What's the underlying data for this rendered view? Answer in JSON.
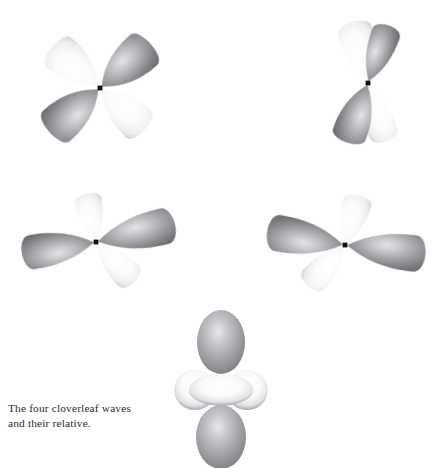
{
  "page": {
    "background_color": "#ffffff",
    "width": 442,
    "height": 468,
    "running_head": "g      y                 %"
  },
  "caption": {
    "line1": "The four cloverleaf waves",
    "line2": "and their relative."
  },
  "palette": {
    "dark_lobe_edge": "#6e6e72",
    "dark_lobe_core": "#d3d3d6",
    "dark_lobe_mid": "#9a9a9e",
    "light_lobe_edge": "#cfcfd4",
    "light_lobe_core": "#ffffff",
    "nucleus": "#111111",
    "torus_edge": "#a9a9ae",
    "torus_core": "#fdfdfd",
    "caption_text": "#2b2b2b"
  },
  "figure": {
    "title": "The four cloverleaf waves and their relative",
    "orbital_count": 5,
    "orbitals": [
      {
        "name": "cloverleaf-top-left",
        "label": "d-orbital cloverleaf, diagonal lobes",
        "cx": 100,
        "cy": 88,
        "lobes": [
          {
            "name": "lobe-upper-left",
            "angle": 139,
            "length": 64,
            "width": 40,
            "shade": "light"
          },
          {
            "name": "lobe-upper-right",
            "angle": 41,
            "length": 68,
            "width": 42,
            "shade": "dark"
          },
          {
            "name": "lobe-lower-left",
            "angle": 221,
            "length": 68,
            "width": 42,
            "shade": "dark"
          },
          {
            "name": "lobe-lower-right",
            "angle": 317,
            "length": 62,
            "width": 38,
            "shade": "light"
          }
        ]
      },
      {
        "name": "cloverleaf-top-right",
        "label": "d-orbital cloverleaf, narrow vertical lobes",
        "cx": 368,
        "cy": 83,
        "lobes": [
          {
            "name": "lobe-upper-left",
            "angle": 104,
            "length": 64,
            "width": 36,
            "shade": "light"
          },
          {
            "name": "lobe-upper-right",
            "angle": 70,
            "length": 62,
            "width": 30,
            "shade": "dark"
          },
          {
            "name": "lobe-lower-left",
            "angle": 250,
            "length": 64,
            "width": 36,
            "shade": "dark"
          },
          {
            "name": "lobe-lower-right",
            "angle": 287,
            "length": 62,
            "width": 30,
            "shade": "light"
          }
        ]
      },
      {
        "name": "cloverleaf-mid-left",
        "label": "d-orbital cloverleaf, flattened lobes",
        "cx": 96,
        "cy": 242,
        "lobes": [
          {
            "name": "lobe-left",
            "angle": 189,
            "length": 76,
            "width": 36,
            "shade": "dark"
          },
          {
            "name": "lobe-right",
            "angle": 13,
            "length": 82,
            "width": 38,
            "shade": "dark"
          },
          {
            "name": "lobe-top",
            "angle": 101,
            "length": 50,
            "width": 28,
            "shade": "light"
          },
          {
            "name": "lobe-bottom-right",
            "angle": 314,
            "length": 56,
            "width": 30,
            "shade": "light"
          }
        ]
      },
      {
        "name": "cloverleaf-mid-right",
        "label": "d-orbital cloverleaf, flattened lobes mirrored",
        "cx": 345,
        "cy": 245,
        "lobes": [
          {
            "name": "lobe-left",
            "angle": 170,
            "length": 80,
            "width": 38,
            "shade": "dark"
          },
          {
            "name": "lobe-right",
            "angle": 353,
            "length": 82,
            "width": 38,
            "shade": "dark"
          },
          {
            "name": "lobe-top-right",
            "angle": 74,
            "length": 52,
            "width": 30,
            "shade": "light"
          },
          {
            "name": "lobe-bottom-left",
            "angle": 228,
            "length": 56,
            "width": 30,
            "shade": "light"
          }
        ]
      }
    ],
    "relative_orbital": {
      "name": "dz2-relative",
      "label": "d z-squared orbital with toroidal collar",
      "cx": 221,
      "cy": 391,
      "top_lobe": {
        "name": "lobe-top",
        "cx": 221,
        "cy": 342,
        "rx": 24,
        "ry": 32,
        "shade": "dark"
      },
      "bottom_lobe": {
        "name": "lobe-bottom",
        "cx": 221,
        "cy": 437,
        "rx": 25,
        "ry": 32,
        "shade": "dark"
      },
      "torus": {
        "name": "torus-collar",
        "cx": 221,
        "cy": 390,
        "rx": 45,
        "ry": 20,
        "shade": "light"
      }
    }
  }
}
